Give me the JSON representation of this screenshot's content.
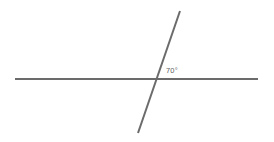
{
  "figure": {
    "background_color": "#ffffff",
    "width": 274,
    "height": 142
  },
  "style": {
    "line_color": "#6b6b6b",
    "line_width": 2,
    "label_color": "#5f5f5f",
    "label_font_size": 7.5
  },
  "chart_data": {
    "type": "diagram",
    "title": "",
    "elements": [
      {
        "name": "horizontal-line",
        "kind": "line",
        "x1": 15,
        "y1": 79,
        "x2": 258,
        "y2": 79,
        "color": "#6b6b6b",
        "width": 2
      },
      {
        "name": "transversal-line",
        "kind": "line",
        "x1": 180,
        "y1": 11,
        "x2": 138,
        "y2": 133,
        "color": "#6b6b6b",
        "width": 2
      }
    ],
    "intersection": {
      "x": 155,
      "y": 79
    },
    "annotations": [
      {
        "name": "angle-70",
        "text": "70°",
        "value": 70,
        "unit": "degrees",
        "x": 166,
        "y": 73
      }
    ]
  },
  "labels": {
    "angle": "70°"
  }
}
